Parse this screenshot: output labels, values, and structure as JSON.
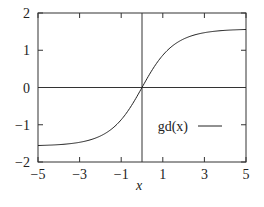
{
  "chart_data": {
    "type": "line",
    "title": "",
    "xlabel": "x",
    "ylabel": "",
    "xlim": [
      -5,
      5
    ],
    "ylim": [
      -2,
      2
    ],
    "xticks": [
      -5,
      -3,
      -1,
      1,
      3,
      5
    ],
    "xtick_labels": [
      "−5",
      "−3",
      "−1",
      "1",
      "3",
      "5"
    ],
    "yticks": [
      -2,
      -1,
      0,
      1,
      2
    ],
    "ytick_labels": [
      "−2",
      "−1",
      "0",
      "1",
      "2"
    ],
    "grid": false,
    "zero_lines": true,
    "legend_position": "lower right",
    "series": [
      {
        "name": "gd(x)",
        "function": "gd(x) = 2*atan(tanh(x/2))",
        "x": [
          -5,
          -4,
          -3,
          -2,
          -1.5,
          -1,
          -0.5,
          0,
          0.5,
          1,
          1.5,
          2,
          3,
          4,
          5
        ],
        "values": [
          -1.5571,
          -1.5342,
          -1.4713,
          -1.3018,
          -1.1317,
          -0.8658,
          -0.4804,
          0,
          0.4804,
          0.8658,
          1.1317,
          1.3018,
          1.4713,
          1.5342,
          1.5571
        ],
        "color": "#222222"
      }
    ]
  },
  "legend": {
    "label": "gd(x)"
  },
  "axes": {
    "xlabel": "x"
  }
}
